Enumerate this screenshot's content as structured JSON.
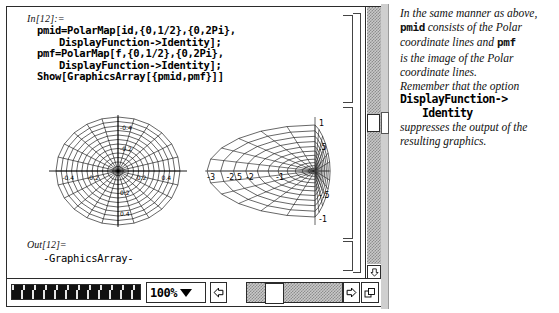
{
  "notebook": {
    "input": {
      "label": "In[12]:=",
      "lines": [
        "pmid=PolarMap[id,{0,1/2},{0,2Pi},",
        "DisplayFunction->Identity];",
        "pmf=PolarMap[f,{0,1/2},{0,2Pi},",
        "DisplayFunction->Identity];",
        "Show[GraphicsArray[{pmid,pmf}]]"
      ]
    },
    "output": {
      "label": "Out[12]=",
      "text": "-GraphicsArray-"
    }
  },
  "chart_data": [
    {
      "type": "line",
      "title": "pmid",
      "description": "Polar coordinate grid: radial spokes and concentric polygonal rings",
      "radial_rings": 12,
      "spokes": 24,
      "r_range": [
        0,
        0.5
      ],
      "theta_range": [
        0,
        6.283185307
      ],
      "xlabel": "",
      "ylabel": "",
      "xticks": [
        "-0.4",
        "-0.2",
        "0.2",
        "0.4"
      ],
      "yticks": [
        "-0.4",
        "-0.2",
        "0.2",
        "0.4"
      ],
      "grid": false,
      "legend": "none"
    },
    {
      "type": "line",
      "title": "pmf",
      "description": "Image of the polar coordinate lines under map f; web compressed toward the right",
      "radial_rings": 12,
      "spokes": 24,
      "xlabel": "",
      "ylabel": "",
      "xticks": [
        "-3",
        "-2.5",
        "-2",
        "-1"
      ],
      "yticks": [
        "1",
        ".5",
        "-.5",
        "-1"
      ],
      "xlim": [
        -3.2,
        0.4
      ],
      "ylim": [
        -1.2,
        1.2
      ],
      "grid": false,
      "legend": "none"
    }
  ],
  "toolbar": {
    "zoom_value": "100%",
    "ruler_name": "magnification-ruler",
    "caret_icon": "chevron-down-icon",
    "left_arrow_icon": "arrow-left-icon",
    "right_arrow_icon": "arrow-right-icon",
    "resize_icon": "window-resize-icon"
  },
  "scrollbar": {
    "down_arrow_icon": "arrow-down-icon"
  },
  "side_panel": {
    "paragraphs": [
      {
        "segments": [
          {
            "text": "In the same manner as above, ",
            "style": "italic"
          },
          {
            "text": "pmid",
            "style": "mono"
          },
          {
            "text": " consists of the Polar coordinate lines and ",
            "style": "italic"
          },
          {
            "text": "pmf",
            "style": "mono"
          },
          {
            "text": " is the image of the Polar coordinate lines.",
            "style": "italic"
          }
        ]
      },
      {
        "segments": [
          {
            "text": "Remember that the option",
            "style": "italic"
          }
        ]
      }
    ],
    "line1": "In the same manner as above,",
    "word_pmid": "pmid",
    "line2": "consists of the Polar",
    "line3": "coordinate lines and",
    "word_pmf": "pmf",
    "line4": "is the image of the Polar",
    "line5": "coordinate lines.",
    "line6": "Remember that the option",
    "code1": "DisplayFunction->",
    "code2": "Identity",
    "line7": "suppresses the output of the",
    "line8": "resulting graphics."
  }
}
